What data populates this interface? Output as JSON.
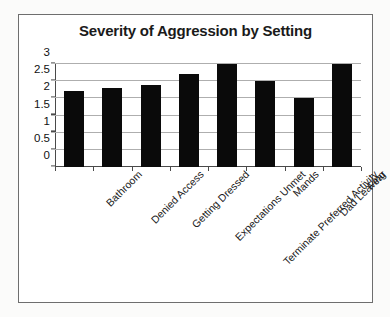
{
  "chart_data": {
    "type": "bar",
    "title": "Severity of Aggression by Setting",
    "xlabel": "",
    "ylabel": "",
    "categories": [
      "Bathroom",
      "Denied Access",
      "Getting Dressed",
      "Expectations Unmet",
      "Terminate Preferred Activity",
      "Mands",
      "Dad Leaving",
      "Fear"
    ],
    "values": [
      2.2,
      2.3,
      2.4,
      2.7,
      3.0,
      2.5,
      2.0,
      3.0
    ],
    "ylim": [
      0,
      3
    ],
    "yticks": [
      "0",
      "0.5",
      "1",
      "1.5",
      "2",
      "2.5",
      "3"
    ],
    "ytick_values": [
      0,
      0.5,
      1,
      1.5,
      2,
      2.5,
      3
    ],
    "grid": true,
    "legend": false,
    "bar_color": "#0a0a0a",
    "gridline_color": "#aeaeae",
    "axis_color": "#4a4a4a",
    "frame_border_color": "#6e6e6e",
    "plot_background": "#ffffff",
    "label_rotation_degrees": -45
  }
}
